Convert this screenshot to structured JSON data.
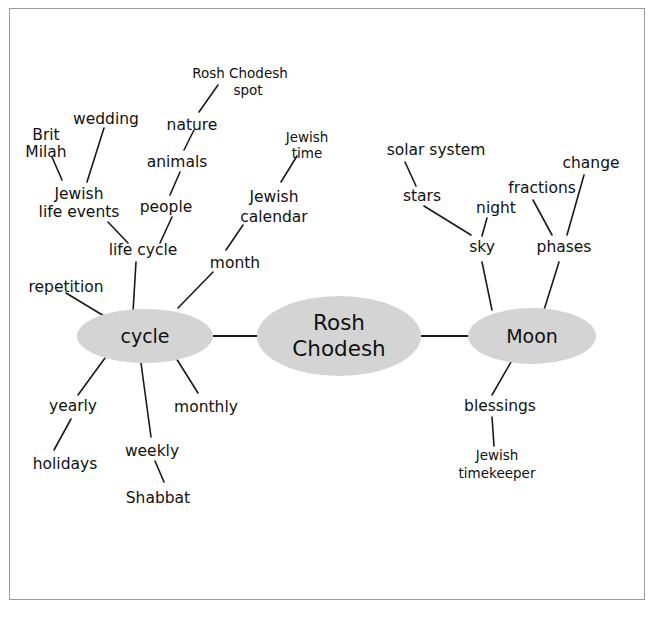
{
  "diagram": {
    "center_node": "Rosh Chodesh",
    "colors": {
      "node_fill": "#d4d4d4",
      "edge": "#1a1a1a",
      "frame": "#9a9a9a",
      "background": "#ffffff",
      "text": "#111111"
    },
    "hubs": [
      {
        "id": "cycle",
        "label": "cycle"
      },
      {
        "id": "center",
        "label_line1": "Rosh",
        "label_line2": "Chodesh"
      },
      {
        "id": "moon",
        "label": "Moon"
      }
    ],
    "nodes": {
      "cycle": "cycle",
      "rosh_chodesh": "Rosh Chodesh",
      "moon": "Moon",
      "repetition": "repetition",
      "life_cycle": "life cycle",
      "jewish_life_events_l1": "Jewish",
      "jewish_life_events_l2": "life events",
      "brit_milah_l1": "Brit",
      "brit_milah_l2": "Milah",
      "wedding": "wedding",
      "people": "people",
      "animals": "animals",
      "nature": "nature",
      "rosh_chodesh_spot_l1": "Rosh Chodesh",
      "rosh_chodesh_spot_l2": "spot",
      "month": "month",
      "jewish_calendar_l1": "Jewish",
      "jewish_calendar_l2": "calendar",
      "jewish_time_l1": "Jewish",
      "jewish_time_l2": "time",
      "yearly": "yearly",
      "holidays": "holidays",
      "weekly": "weekly",
      "shabbat": "Shabbat",
      "monthly": "monthly",
      "sky": "sky",
      "night": "night",
      "stars": "stars",
      "solar_system": "solar system",
      "phases": "phases",
      "fractions": "fractions",
      "change": "change",
      "blessings": "blessings",
      "jewish_timekeeper_l1": "Jewish",
      "jewish_timekeeper_l2": "timekeeper"
    },
    "edges": [
      {
        "from": "cycle",
        "to": "rosh_chodesh"
      },
      {
        "from": "rosh_chodesh",
        "to": "moon"
      },
      {
        "from": "cycle",
        "to": "repetition"
      },
      {
        "from": "cycle",
        "to": "life_cycle"
      },
      {
        "from": "cycle",
        "to": "month"
      },
      {
        "from": "cycle",
        "to": "yearly"
      },
      {
        "from": "cycle",
        "to": "weekly"
      },
      {
        "from": "cycle",
        "to": "monthly"
      },
      {
        "from": "life_cycle",
        "to": "jewish_life_events"
      },
      {
        "from": "life_cycle",
        "to": "people"
      },
      {
        "from": "jewish_life_events",
        "to": "brit_milah"
      },
      {
        "from": "jewish_life_events",
        "to": "wedding"
      },
      {
        "from": "people",
        "to": "animals"
      },
      {
        "from": "animals",
        "to": "nature"
      },
      {
        "from": "nature",
        "to": "rosh_chodesh_spot"
      },
      {
        "from": "month",
        "to": "jewish_calendar"
      },
      {
        "from": "jewish_calendar",
        "to": "jewish_time"
      },
      {
        "from": "yearly",
        "to": "holidays"
      },
      {
        "from": "weekly",
        "to": "shabbat"
      },
      {
        "from": "moon",
        "to": "sky"
      },
      {
        "from": "moon",
        "to": "phases"
      },
      {
        "from": "moon",
        "to": "blessings"
      },
      {
        "from": "sky",
        "to": "night"
      },
      {
        "from": "sky",
        "to": "stars"
      },
      {
        "from": "stars",
        "to": "solar_system"
      },
      {
        "from": "phases",
        "to": "fractions"
      },
      {
        "from": "phases",
        "to": "change"
      },
      {
        "from": "blessings",
        "to": "jewish_timekeeper"
      }
    ]
  }
}
